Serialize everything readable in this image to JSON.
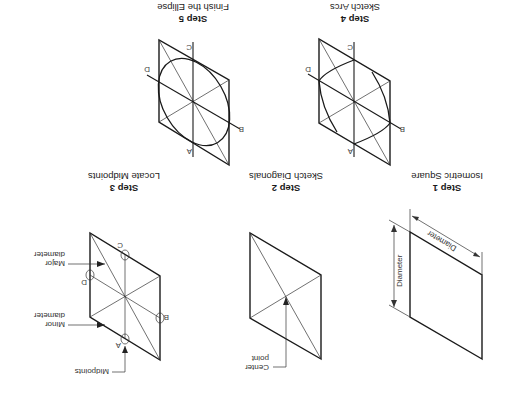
{
  "figure": {
    "orientation": "rotated 180 degrees",
    "steps": [
      {
        "number": "Step 1",
        "title": "Isometric Square",
        "annotations": {
          "top_dimension": "Diameter",
          "side_dimension": "Diameter"
        }
      },
      {
        "number": "Step 2",
        "title": "Sketch Diagonals",
        "annotations": {
          "center_label_1": "Center",
          "center_label_2": "point"
        }
      },
      {
        "number": "Step 3",
        "title": "Locate Midpoints",
        "annotations": {
          "midpoints": "Midpoints",
          "minor_1": "Minor",
          "minor_2": "diameter",
          "major_1": "Major",
          "major_2": "diameter"
        }
      },
      {
        "number": "Step 4",
        "title": "Sketch Arcs"
      },
      {
        "number": "Step 5",
        "title": "Finish the Ellipse"
      }
    ],
    "point_labels": {
      "a": "A",
      "b": "B",
      "c": "C",
      "d": "D"
    }
  }
}
